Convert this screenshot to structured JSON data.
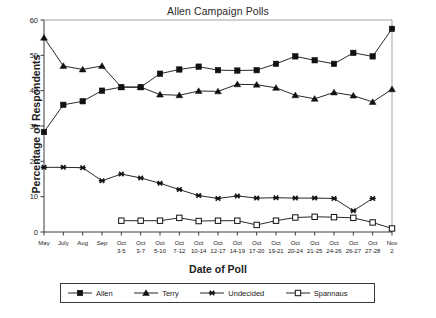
{
  "chart_data": {
    "type": "line",
    "title": "Allen Campaign Polls",
    "xlabel": "Date of Poll",
    "ylabel": "Percentage of Respondents",
    "ylim": [
      0,
      60
    ],
    "yticks": [
      0,
      10,
      20,
      30,
      40,
      50,
      60
    ],
    "grid": false,
    "legend_position": "below-axes",
    "categories": [
      "May",
      "July",
      "Aug",
      "Sep",
      "Oct 3-5",
      "Oct 3-7",
      "Oct 5-10",
      "Oct 7-12",
      "Oct 10-14",
      "Oct 12-17",
      "Oct 14-19",
      "Oct 17-20",
      "Oct 19-21",
      "Oct 20-24",
      "Oct 21-25",
      "Oct 24-26",
      "Oct 26-27",
      "Oct 27-28",
      "Nov 2"
    ],
    "xtick_labels_top": [
      "May",
      "July",
      "Aug",
      "Sep",
      "Oct",
      "Oct",
      "Oct",
      "Oct",
      "Oct",
      "Oct",
      "Oct",
      "Oct",
      "Oct",
      "Oct",
      "Oct",
      "Oct",
      "Oct",
      "Oct",
      "Nov"
    ],
    "xtick_labels_bottom": [
      "",
      "",
      "",
      "",
      "3-5",
      "3-7",
      "5-10",
      "7-12",
      "10-14",
      "12-17",
      "14-19",
      "17-20",
      "19-21",
      "20-24",
      "21-25",
      "24-26",
      "26-27",
      "27-28",
      "2"
    ],
    "series": [
      {
        "name": "Allen",
        "marker": "filled-square",
        "color": "#111111",
        "values": [
          28.3,
          36.0,
          37.0,
          40.0,
          41.0,
          41.0,
          44.8,
          46.0,
          46.8,
          45.8,
          45.7,
          45.8,
          47.6,
          49.7,
          48.6,
          47.6,
          50.7,
          49.7,
          57.5
        ]
      },
      {
        "name": "Terry",
        "marker": "filled-triangle",
        "color": "#111111",
        "values": [
          55.0,
          47.0,
          46.0,
          47.0,
          41.0,
          41.0,
          38.9,
          38.7,
          39.9,
          39.8,
          41.8,
          41.7,
          40.8,
          38.7,
          37.7,
          39.5,
          38.6,
          36.8,
          40.4
        ]
      },
      {
        "name": "Undecided",
        "marker": "cross-star",
        "color": "#111111",
        "values": [
          18.3,
          18.3,
          18.2,
          14.5,
          16.4,
          15.3,
          13.8,
          12.0,
          10.3,
          9.5,
          10.2,
          9.6,
          9.7,
          9.6,
          9.6,
          9.5,
          6.0,
          9.5,
          null
        ]
      },
      {
        "name": "Spannaus",
        "marker": "open-square",
        "color": "#111111",
        "values": [
          null,
          null,
          null,
          null,
          3.2,
          3.2,
          3.2,
          4.0,
          3.1,
          3.2,
          3.2,
          2.0,
          3.2,
          4.1,
          4.3,
          4.2,
          4.0,
          2.7,
          1.0
        ]
      }
    ]
  },
  "legend": {
    "entries": [
      {
        "label": "Allen",
        "marker": "filled-square"
      },
      {
        "label": "Terry",
        "marker": "filled-triangle"
      },
      {
        "label": "Undecided",
        "marker": "cross-star"
      },
      {
        "label": "Spannaus",
        "marker": "open-square"
      }
    ]
  },
  "colors": {
    "ink": "#111111",
    "axis": "#3a3a3a",
    "background": "#ffffff"
  }
}
